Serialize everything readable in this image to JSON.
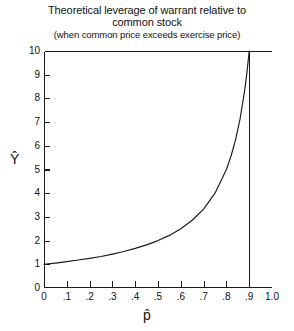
{
  "chart_data": {
    "type": "line",
    "title": "Theoretical leverage of warrant relative to common stock",
    "title_lines": [
      "Theoretical leverage of warrant relative to",
      "common stock"
    ],
    "subtitle": "(when common price exceeds exercise price)",
    "xlabel": "p̂",
    "ylabel": "Ŷ",
    "xlim": [
      0,
      1.0
    ],
    "ylim": [
      0,
      10
    ],
    "grid": false,
    "legend": null,
    "xticks": [
      0,
      0.1,
      0.2,
      0.3,
      0.4,
      0.5,
      0.6,
      0.7,
      0.8,
      0.9,
      1.0
    ],
    "xtick_labels": [
      "0",
      ".1",
      ".2",
      ".3",
      ".4",
      ".5",
      ".6",
      ".7",
      ".8",
      ".9",
      "1.0"
    ],
    "yticks": [
      0,
      1,
      2,
      3,
      4,
      5,
      6,
      7,
      8,
      9,
      10
    ],
    "ytick_labels": [
      "0",
      "1",
      "2",
      "3",
      "4",
      "5",
      "6",
      "7",
      "8",
      "9",
      "10"
    ],
    "series": [
      {
        "name": "Theoretical leverage",
        "relation": "Ŷ = 1 / (1 − p̂)",
        "x": [
          0.0,
          0.05,
          0.1,
          0.15,
          0.2,
          0.25,
          0.3,
          0.35,
          0.4,
          0.45,
          0.5,
          0.55,
          0.6,
          0.65,
          0.7,
          0.75,
          0.8,
          0.82,
          0.84,
          0.86,
          0.88,
          0.89,
          0.9
        ],
        "values": [
          1.0,
          1.05,
          1.11,
          1.18,
          1.25,
          1.33,
          1.43,
          1.54,
          1.67,
          1.82,
          2.0,
          2.22,
          2.5,
          2.86,
          3.33,
          4.0,
          5.0,
          5.56,
          6.25,
          7.14,
          8.33,
          9.09,
          10.0
        ],
        "color": "#1a1a1a"
      }
    ]
  },
  "figure": {
    "background": "#ffffff",
    "line_color": "#1a1a1a",
    "axis_color": "#1a1a1a"
  }
}
